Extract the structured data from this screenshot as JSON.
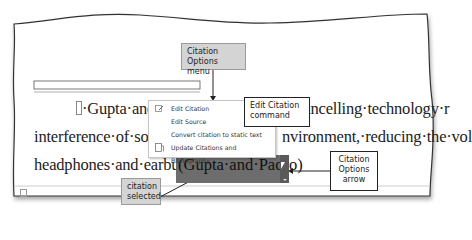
{
  "document": {
    "line1_pre": "·Gupta·and·P",
    "line1_post": "-cancelling·technology·r",
    "line2_pre": "interference·of·sound",
    "line2_post": "nvironment,·reducing·the·vol",
    "line3_pre": "headphones·and·earbuds·",
    "citation": "(Gupta·and·Padro)",
    "line3_post": "."
  },
  "context_menu": {
    "items": [
      {
        "label": "Edit Citation",
        "icon": "edit-citation-icon"
      },
      {
        "label": "Edit Source",
        "icon": ""
      },
      {
        "label": "Convert citation to static text",
        "icon": ""
      },
      {
        "label": "Update Citations and Bibliography",
        "icon": "update-citations-icon"
      }
    ]
  },
  "callouts": {
    "citation_options_menu": "Citation Options menu",
    "edit_citation_command": "Edit Citation command",
    "citation_options_arrow": "Citation Options arrow",
    "citation_selected": "citation selected"
  },
  "colors": {
    "selection": "#6d6d6d",
    "callout_gray": "#d4d4d4"
  }
}
